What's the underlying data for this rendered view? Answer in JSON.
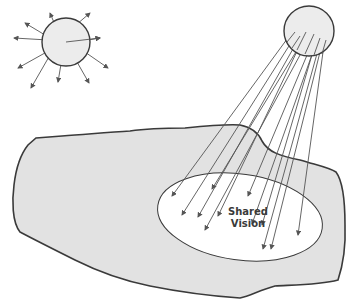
{
  "diagram": {
    "title": "",
    "elements": {
      "scattered_source": {
        "shape": "circle",
        "description": "small circle radiating arrows in all directions",
        "arrow_count": 10
      },
      "focused_source": {
        "shape": "circle",
        "description": "circle emitting parallel arrows toward shared vision",
        "arrow_count": 13
      },
      "organization_area": {
        "shape": "irregular blob",
        "fill": "#e2e2e2"
      },
      "shared_vision_area": {
        "shape": "ellipse",
        "fill": "#ffffff"
      }
    },
    "labels": {
      "shared_vision_line1": "Shared",
      "shared_vision_line2": "Vision"
    },
    "colors": {
      "fill_gray": "#e2e2e2",
      "stroke": "#3a3a3a",
      "arrow": "#555555"
    }
  }
}
